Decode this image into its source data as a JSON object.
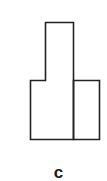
{
  "figure": {
    "label": "c",
    "stroke_color": "#222222",
    "shapes": {
      "tall_block": "tall-left-block",
      "short_block": "short-right-block"
    }
  }
}
